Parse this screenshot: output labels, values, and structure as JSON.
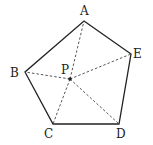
{
  "diagram": {
    "type": "geometry",
    "shape": "pentagon",
    "vertices": [
      {
        "id": "A",
        "label": "A",
        "x": 84,
        "y": 21,
        "lx": 80,
        "ly": 15
      },
      {
        "id": "E",
        "label": "E",
        "x": 131,
        "y": 54,
        "lx": 133,
        "ly": 58
      },
      {
        "id": "D",
        "label": "D",
        "x": 119,
        "y": 124,
        "lx": 116,
        "ly": 138
      },
      {
        "id": "C",
        "label": "C",
        "x": 53,
        "y": 124,
        "lx": 44,
        "ly": 138
      },
      {
        "id": "B",
        "label": "B",
        "x": 25,
        "y": 72,
        "lx": 10,
        "ly": 77
      }
    ],
    "interior_point": {
      "id": "P",
      "label": "P",
      "x": 70,
      "y": 79,
      "lx": 61,
      "ly": 74
    },
    "edges": [
      "AE",
      "ED",
      "DC",
      "CB",
      "BA"
    ],
    "dashed_segments": [
      "PA",
      "PB",
      "PC",
      "PD",
      "PE"
    ],
    "colors": {
      "stroke": "#222222",
      "dashed": "#444444",
      "background": "#ffffff"
    }
  }
}
